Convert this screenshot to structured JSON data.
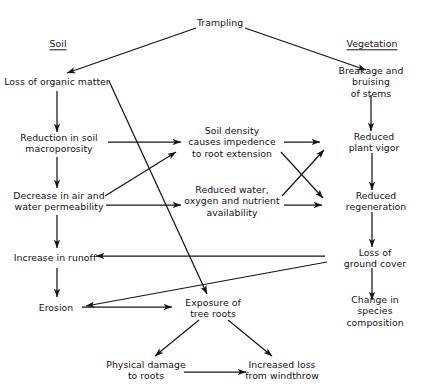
{
  "diagram": {
    "type": "flowchart",
    "width": 440,
    "height": 392,
    "background_color": "#ffffff",
    "line_color": "#1a1413",
    "text_color": "#15100f",
    "nodes": [
      {
        "id": "trampling",
        "label": "Trampling",
        "x": 220,
        "y": 23,
        "heading": false
      },
      {
        "id": "soil",
        "label": "Soil",
        "x": 58,
        "y": 44,
        "heading": true
      },
      {
        "id": "vegetation",
        "label": "Vegetation",
        "x": 372,
        "y": 44,
        "heading": true
      },
      {
        "id": "organic",
        "label": "Loss of organic matter",
        "x": 57,
        "y": 82,
        "heading": false
      },
      {
        "id": "breakage",
        "label": "Breakage and bruising\nof stems",
        "x": 371,
        "y": 82,
        "heading": false
      },
      {
        "id": "macroporosity",
        "label": "Reduction in soil\nmacroporosity",
        "x": 59,
        "y": 143,
        "heading": false
      },
      {
        "id": "soildensity",
        "label": "Soil density\ncauses impedence\nto root extension",
        "x": 232,
        "y": 142,
        "heading": false
      },
      {
        "id": "plantvigor",
        "label": "Reduced plant vigor",
        "x": 374,
        "y": 142,
        "heading": false
      },
      {
        "id": "permeability",
        "label": "Decrease in air and\nwater permeability",
        "x": 59,
        "y": 201,
        "heading": false
      },
      {
        "id": "water",
        "label": "Reduced water,\noxygen and nutrient\navailability",
        "x": 232,
        "y": 201,
        "heading": false
      },
      {
        "id": "regeneration",
        "label": "Reduced regeneration",
        "x": 376,
        "y": 201,
        "heading": false
      },
      {
        "id": "runoff",
        "label": "Increase in runoff",
        "x": 55,
        "y": 258,
        "heading": false
      },
      {
        "id": "groundcover",
        "label": "Loss of ground cover",
        "x": 375,
        "y": 258,
        "heading": false
      },
      {
        "id": "erosion",
        "label": "Erosion",
        "x": 56,
        "y": 308,
        "heading": false
      },
      {
        "id": "treeroots",
        "label": "Exposure of\ntree roots",
        "x": 213,
        "y": 308,
        "heading": false
      },
      {
        "id": "species",
        "label": "Change in species\ncomposition",
        "x": 375,
        "y": 311,
        "heading": false
      },
      {
        "id": "physical",
        "label": "Physical damage\nto roots",
        "x": 146,
        "y": 370,
        "heading": false
      },
      {
        "id": "windthrow",
        "label": "Increased loss\nfrom windthrow",
        "x": 282,
        "y": 370,
        "heading": false
      }
    ],
    "edges": [
      {
        "from": "trampling",
        "to": "organic",
        "x1": 196,
        "y1": 28,
        "x2": 67,
        "y2": 73
      },
      {
        "from": "trampling",
        "to": "breakage",
        "x1": 245,
        "y1": 28,
        "x2": 366,
        "y2": 70
      },
      {
        "from": "organic",
        "to": "macroporosity",
        "x1": 57,
        "y1": 91,
        "x2": 57,
        "y2": 132
      },
      {
        "from": "organic",
        "to": "treeroots",
        "x1": 109,
        "y1": 81,
        "x2": 207,
        "y2": 294
      },
      {
        "from": "breakage",
        "to": "plantvigor",
        "x1": 371,
        "y1": 95,
        "x2": 371,
        "y2": 131
      },
      {
        "from": "macroporosity",
        "to": "soildensity",
        "x1": 108,
        "y1": 142,
        "x2": 181,
        "y2": 142
      },
      {
        "from": "macroporosity",
        "to": "permeability",
        "x1": 57,
        "y1": 157,
        "x2": 57,
        "y2": 188
      },
      {
        "from": "soildensity",
        "to": "plantvigor",
        "x1": 284,
        "y1": 142,
        "x2": 320,
        "y2": 142
      },
      {
        "from": "soildensity",
        "to": "regeneration",
        "x1": 281,
        "y1": 152,
        "x2": 323,
        "y2": 198
      },
      {
        "from": "permeability",
        "to": "soildensity",
        "x1": 105,
        "y1": 196,
        "x2": 176,
        "y2": 152
      },
      {
        "from": "permeability",
        "to": "water",
        "x1": 106,
        "y1": 205,
        "x2": 181,
        "y2": 205
      },
      {
        "from": "permeability",
        "to": "runoff",
        "x1": 57,
        "y1": 215,
        "x2": 57,
        "y2": 248
      },
      {
        "from": "water",
        "to": "regeneration",
        "x1": 284,
        "y1": 205,
        "x2": 322,
        "y2": 205
      },
      {
        "from": "water",
        "to": "plantvigor",
        "x1": 282,
        "y1": 196,
        "x2": 324,
        "y2": 150
      },
      {
        "from": "plantvigor",
        "to": "regeneration",
        "x1": 372,
        "y1": 153,
        "x2": 372,
        "y2": 190
      },
      {
        "from": "regeneration",
        "to": "groundcover",
        "x1": 372,
        "y1": 212,
        "x2": 372,
        "y2": 247
      },
      {
        "from": "groundcover",
        "to": "runoff",
        "x1": 325,
        "y1": 256,
        "x2": 96,
        "y2": 256
      },
      {
        "from": "groundcover",
        "to": "erosion",
        "x1": 327,
        "y1": 262,
        "x2": 86,
        "y2": 306
      },
      {
        "from": "groundcover",
        "to": "species",
        "x1": 372,
        "y1": 268,
        "x2": 372,
        "y2": 300
      },
      {
        "from": "runoff",
        "to": "erosion",
        "x1": 57,
        "y1": 268,
        "x2": 57,
        "y2": 297
      },
      {
        "from": "erosion",
        "to": "treeroots",
        "x1": 82,
        "y1": 307,
        "x2": 172,
        "y2": 307
      },
      {
        "from": "treeroots",
        "to": "physical",
        "x1": 199,
        "y1": 320,
        "x2": 155,
        "y2": 356
      },
      {
        "from": "treeroots",
        "to": "windthrow",
        "x1": 228,
        "y1": 320,
        "x2": 272,
        "y2": 356
      },
      {
        "from": "physical",
        "to": "windthrow",
        "x1": 184,
        "y1": 372,
        "x2": 246,
        "y2": 372
      }
    ]
  }
}
